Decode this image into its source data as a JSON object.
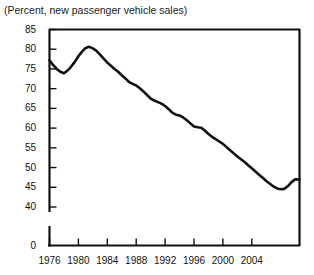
{
  "chart_data": {
    "type": "line",
    "title": "(Percent, new passenger vehicle sales)",
    "xlabel": "",
    "ylabel": "",
    "ylim": [
      40,
      85
    ],
    "xlim": [
      1976,
      2010.6
    ],
    "yticks": [
      85,
      80,
      75,
      70,
      65,
      60,
      55,
      50,
      45,
      40
    ],
    "ytick_labels": [
      "85",
      "80",
      "75",
      "70",
      "65",
      "60",
      "55",
      "50",
      "45",
      "40"
    ],
    "axis_break_label": "0",
    "xticks": [
      1976,
      1980,
      1984,
      1988,
      1992,
      1996,
      2000,
      2004
    ],
    "xtick_labels": [
      "1976",
      "1980",
      "1984",
      "1988",
      "1992",
      "1996",
      "2000",
      "2004"
    ],
    "grid": false,
    "legend": null,
    "line_color": "#111111",
    "background_color": "#ffffff",
    "series": [
      {
        "name": "Car share of new passenger vehicle sales",
        "x": [
          1976,
          1976.5,
          1977,
          1977.5,
          1978,
          1978.5,
          1979,
          1979.5,
          1980,
          1980.5,
          1981,
          1981.5,
          1982,
          1982.5,
          1983,
          1983.5,
          1984,
          1984.5,
          1985,
          1985.5,
          1986,
          1986.5,
          1987,
          1987.5,
          1988,
          1988.5,
          1989,
          1989.5,
          1990,
          1990.5,
          1991,
          1991.5,
          1992,
          1992.5,
          1993,
          1993.5,
          1994,
          1994.5,
          1995,
          1995.5,
          1996,
          1996.5,
          1997,
          1997.5,
          1998,
          1998.5,
          1999,
          1999.5,
          2000,
          2000.5,
          2001,
          2001.5,
          2002,
          2002.5,
          2003,
          2003.5,
          2004,
          2004.5,
          2005,
          2005.5,
          2006,
          2006.5,
          2007,
          2007.5,
          2008,
          2008.5,
          2009,
          2009.5,
          2010,
          2010.6
        ],
        "values": [
          77.2,
          76.0,
          75.0,
          74.3,
          73.9,
          74.6,
          75.6,
          76.8,
          78.2,
          79.4,
          80.3,
          80.6,
          80.2,
          79.6,
          78.6,
          77.6,
          76.6,
          75.8,
          75.0,
          74.3,
          73.4,
          72.6,
          71.7,
          71.2,
          70.8,
          70.1,
          69.3,
          68.4,
          67.5,
          67.0,
          66.6,
          66.2,
          65.6,
          64.8,
          63.9,
          63.4,
          63.2,
          62.7,
          62.0,
          61.2,
          60.4,
          60.2,
          60.1,
          59.4,
          58.5,
          57.8,
          57.2,
          56.6,
          56.0,
          55.2,
          54.4,
          53.6,
          52.8,
          52.1,
          51.4,
          50.6,
          49.8,
          49.0,
          48.2,
          47.4,
          46.6,
          45.9,
          45.2,
          44.7,
          44.5,
          44.6,
          45.3,
          46.3,
          47.0,
          47.0
        ]
      }
    ]
  }
}
